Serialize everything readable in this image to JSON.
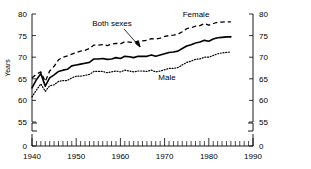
{
  "chart_data": {
    "type": "line",
    "title": "",
    "xlabel": "",
    "ylabel": "Years",
    "xlim": [
      1940,
      1990
    ],
    "ylim": [
      55,
      80
    ],
    "y_axis_break": true,
    "y_break_value": 0,
    "grid": false,
    "legend": "inline-annotations",
    "xticks": [
      1940,
      1950,
      1960,
      1970,
      1980,
      1990
    ],
    "xtick_labels": [
      "1940",
      "1950",
      "1960",
      "1970",
      "1980",
      "1990"
    ],
    "x_minor_tick_interval": 1,
    "yticks": [
      0,
      55,
      60,
      65,
      70,
      75,
      80
    ],
    "ytick_labels": [
      "0",
      "55",
      "60",
      "65",
      "70",
      "75",
      "80"
    ],
    "right_axis_mirrored": true,
    "right_ytick_labels": [
      "0",
      "55",
      "60",
      "65",
      "70",
      "75",
      "80"
    ],
    "x": [
      1940,
      1941,
      1942,
      1943,
      1944,
      1945,
      1946,
      1947,
      1948,
      1949,
      1950,
      1951,
      1952,
      1953,
      1954,
      1955,
      1956,
      1957,
      1958,
      1959,
      1960,
      1961,
      1962,
      1963,
      1964,
      1965,
      1966,
      1967,
      1968,
      1969,
      1970,
      1971,
      1972,
      1973,
      1974,
      1975,
      1976,
      1977,
      1978,
      1979,
      1980,
      1981,
      1982,
      1983,
      1984,
      1985
    ],
    "series": [
      {
        "name": "Female",
        "style": "dashed",
        "values": [
          65.2,
          66.1,
          66.6,
          64.4,
          66.8,
          67.9,
          69.4,
          70.0,
          70.3,
          70.7,
          71.1,
          71.4,
          71.6,
          72.0,
          72.8,
          72.8,
          72.9,
          72.7,
          73.0,
          73.2,
          73.1,
          73.6,
          73.5,
          73.4,
          73.7,
          73.8,
          73.9,
          74.3,
          74.2,
          74.4,
          74.8,
          75.0,
          75.1,
          75.3,
          75.9,
          76.6,
          76.8,
          77.2,
          77.3,
          77.8,
          77.4,
          77.8,
          78.1,
          78.1,
          78.2,
          78.2
        ]
      },
      {
        "name": "Both sexes",
        "style": "solid",
        "values": [
          62.9,
          64.8,
          66.2,
          63.3,
          65.2,
          65.9,
          66.7,
          67.0,
          67.2,
          68.0,
          68.2,
          68.4,
          68.6,
          68.8,
          69.6,
          69.6,
          69.7,
          69.5,
          69.6,
          69.9,
          69.7,
          70.2,
          70.1,
          69.9,
          70.2,
          70.2,
          70.2,
          70.5,
          70.2,
          70.5,
          70.8,
          71.1,
          71.2,
          71.4,
          72.0,
          72.6,
          72.9,
          73.3,
          73.5,
          73.9,
          73.7,
          74.2,
          74.5,
          74.6,
          74.7,
          74.7
        ]
      },
      {
        "name": "Male",
        "style": "dotted",
        "values": [
          60.8,
          62.4,
          63.8,
          62.1,
          63.4,
          63.6,
          64.4,
          64.6,
          64.6,
          65.2,
          65.6,
          65.6,
          65.8,
          66.0,
          66.7,
          66.7,
          66.7,
          66.4,
          66.6,
          66.8,
          66.6,
          67.0,
          66.8,
          66.6,
          66.8,
          66.8,
          66.7,
          67.0,
          66.6,
          66.8,
          67.1,
          67.4,
          67.4,
          67.6,
          68.2,
          68.8,
          69.1,
          69.5,
          69.6,
          70.0,
          70.0,
          70.4,
          70.8,
          71.0,
          71.1,
          71.2
        ]
      }
    ],
    "annotations": [
      {
        "text": "Female",
        "series": "Female"
      },
      {
        "text": "Both sexes",
        "series": "Both sexes",
        "has_arrow": true
      },
      {
        "text": "Male",
        "series": "Male"
      }
    ]
  },
  "labels": {
    "y_axis_title": "Years",
    "female": "Female",
    "both_sexes": "Both sexes",
    "male": "Male"
  }
}
